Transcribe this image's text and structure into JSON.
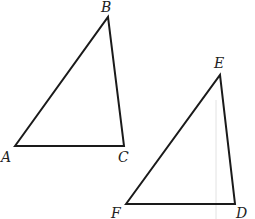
{
  "figure": {
    "triangle_1": {
      "vertices": [
        {
          "label": "A",
          "x": 15,
          "y": 146,
          "lx": 1,
          "ly": 150
        },
        {
          "label": "B",
          "x": 108,
          "y": 17,
          "lx": 101,
          "ly": 0
        },
        {
          "label": "C",
          "x": 124,
          "y": 146,
          "lx": 118,
          "ly": 150
        }
      ]
    },
    "triangle_2": {
      "vertices": [
        {
          "label": "E",
          "x": 220,
          "y": 75,
          "lx": 214,
          "ly": 56
        },
        {
          "label": "F",
          "x": 126,
          "y": 204,
          "lx": 111,
          "ly": 206
        },
        {
          "label": "D",
          "x": 235,
          "y": 204,
          "lx": 236,
          "ly": 206
        }
      ]
    },
    "stroke_color": "#1a1a1a",
    "guide_line_color": "#dcdcdc"
  }
}
